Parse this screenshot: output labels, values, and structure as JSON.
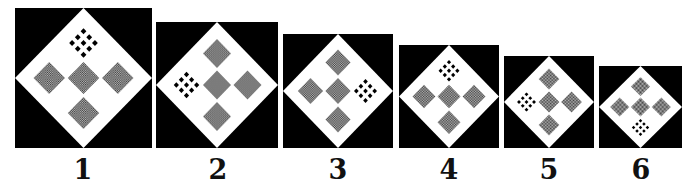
{
  "figure": {
    "colors": {
      "background": "#000000",
      "diamond": "#ffffff",
      "distractor_texture_dark": "#3a3a3a",
      "distractor_texture_light": "#bdbdbd",
      "target": "#000000"
    },
    "panels": [
      {
        "label": "1",
        "target_position": "top"
      },
      {
        "label": "2",
        "target_position": "left"
      },
      {
        "label": "3",
        "target_position": "right"
      },
      {
        "label": "4",
        "target_position": "top"
      },
      {
        "label": "5",
        "target_position": "left"
      },
      {
        "label": "6",
        "target_position": "bottom"
      }
    ]
  }
}
